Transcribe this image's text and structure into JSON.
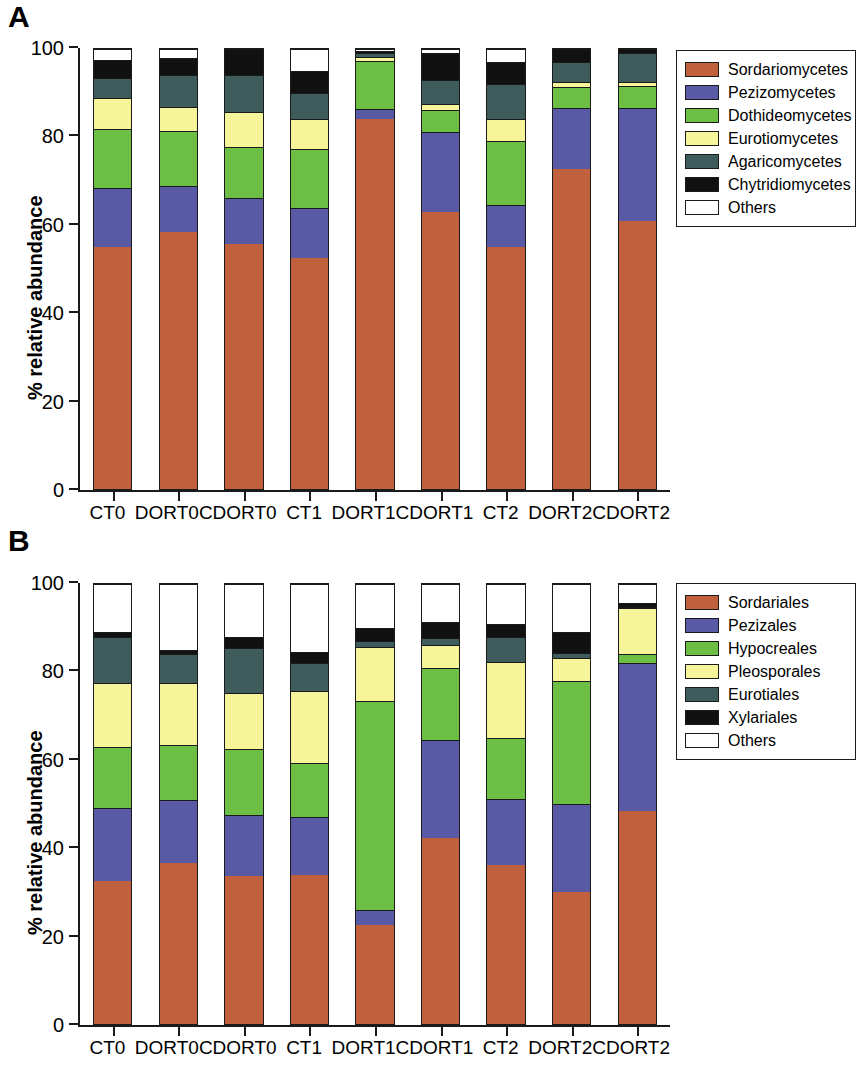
{
  "figure": {
    "panels": [
      {
        "letter": "A",
        "y_axis_title": "% relative abundance",
        "x_axis_title": "",
        "chart_data": {
          "type": "bar",
          "title": "",
          "subtitle": "",
          "xlabel": "",
          "ylabel": "% relative abundance",
          "ylim": [
            0,
            100
          ],
          "yticks": [
            0,
            20,
            40,
            60,
            80,
            100
          ],
          "grid": false,
          "stacked": true,
          "stack_mode": "percent",
          "legend_position": "right",
          "categories": [
            "CT0",
            "DORT0",
            "CDORT0",
            "CT1",
            "DORT1",
            "CDORT1",
            "CT2",
            "DORT2",
            "CDORT2"
          ],
          "series": [
            {
              "name": "Sordariomycetes",
              "color": "#c0603c",
              "values": [
                55.0,
                58.3,
                55.6,
                52.4,
                84.2,
                62.9,
                55.0,
                72.7,
                61.0
              ]
            },
            {
              "name": "Pezizomycetes",
              "color": "#595aa6",
              "values": [
                13.5,
                10.6,
                10.6,
                11.4,
                2.2,
                18.2,
                9.6,
                13.8,
                25.6
              ]
            },
            {
              "name": "Dothideomycetes",
              "color": "#6cbe45",
              "values": [
                13.4,
                12.5,
                11.5,
                13.4,
                10.9,
                5.0,
                14.4,
                4.8,
                5.0
              ]
            },
            {
              "name": "Eurotiomycetes",
              "color": "#f7f59a",
              "values": [
                7.0,
                5.5,
                8.1,
                7.0,
                1.0,
                1.5,
                5.0,
                1.2,
                1.0
              ]
            },
            {
              "name": "Agaricomycetes",
              "color": "#3e5c5c",
              "values": [
                4.6,
                7.1,
                8.2,
                5.8,
                0.7,
                5.4,
                8.0,
                4.5,
                6.4
              ]
            },
            {
              "name": "Chytridiomycetes",
              "color": "#111111",
              "values": [
                4.0,
                4.0,
                6.0,
                5.0,
                0.5,
                6.0,
                5.0,
                3.0,
                1.0
              ]
            },
            {
              "name": "Others",
              "color": "#ffffff",
              "values": [
                2.5,
                2.0,
                0.0,
                5.0,
                0.5,
                1.0,
                3.0,
                0.0,
                0.0
              ]
            }
          ]
        },
        "legend": {
          "items": [
            {
              "label": "Sordariomycetes",
              "color": "#c0603c"
            },
            {
              "label": "Pezizomycetes",
              "color": "#595aa6"
            },
            {
              "label": "Dothideomycetes",
              "color": "#6cbe45"
            },
            {
              "label": "Eurotiomycetes",
              "color": "#f7f59a"
            },
            {
              "label": "Agaricomycetes",
              "color": "#3e5c5c"
            },
            {
              "label": "Chytridiomycetes",
              "color": "#111111"
            },
            {
              "label": "Others",
              "color": "#ffffff"
            }
          ]
        }
      },
      {
        "letter": "B",
        "y_axis_title": "% relative abundance",
        "x_axis_title": "Samples",
        "chart_data": {
          "type": "bar",
          "title": "",
          "subtitle": "",
          "xlabel": "Samples",
          "ylabel": "% relative abundance",
          "ylim": [
            0,
            100
          ],
          "yticks": [
            0,
            20,
            40,
            60,
            80,
            100
          ],
          "grid": false,
          "stacked": true,
          "stack_mode": "percent",
          "legend_position": "right",
          "categories": [
            "CT0",
            "DORT0",
            "CDORT0",
            "CT1",
            "DORT1",
            "CDORT1",
            "CT2",
            "DORT2",
            "CDORT2"
          ],
          "series": [
            {
              "name": "Sordariales",
              "color": "#c0603c",
              "values": [
                32.5,
                36.7,
                33.6,
                33.9,
                22.4,
                42.2,
                36.1,
                30.1,
                48.4
              ]
            },
            {
              "name": "Pezizales",
              "color": "#595aa6",
              "values": [
                16.5,
                14.2,
                14.0,
                13.2,
                3.6,
                22.3,
                15.0,
                19.8,
                33.7
              ]
            },
            {
              "name": "Hypocreales",
              "color": "#6cbe45",
              "values": [
                14.0,
                12.6,
                15.0,
                12.2,
                47.5,
                16.4,
                13.8,
                28.0,
                1.9
              ]
            },
            {
              "name": "Pleosporales",
              "color": "#f7f59a",
              "values": [
                14.5,
                13.9,
                12.6,
                16.5,
                12.1,
                5.3,
                17.4,
                5.4,
                10.5
              ]
            },
            {
              "name": "Eurotiales",
              "color": "#3e5c5c",
              "values": [
                10.5,
                6.7,
                10.3,
                6.3,
                1.4,
                1.6,
                5.6,
                1.1,
                0.3
              ]
            },
            {
              "name": "Xylariales",
              "color": "#111111",
              "values": [
                1.0,
                1.0,
                2.5,
                2.4,
                3.0,
                3.5,
                3.1,
                4.6,
                1.0
              ]
            },
            {
              "name": "Others",
              "color": "#ffffff",
              "values": [
                11.0,
                14.9,
                12.0,
                15.5,
                10.0,
                8.7,
                9.0,
                11.0,
                4.2
              ]
            }
          ]
        },
        "legend": {
          "items": [
            {
              "label": "Sordariales",
              "color": "#c0603c"
            },
            {
              "label": "Pezizales",
              "color": "#595aa6"
            },
            {
              "label": "Hypocreales",
              "color": "#6cbe45"
            },
            {
              "label": "Pleosporales",
              "color": "#f7f59a"
            },
            {
              "label": "Eurotiales",
              "color": "#3e5c5c"
            },
            {
              "label": "Xylariales",
              "color": "#111111"
            },
            {
              "label": "Others",
              "color": "#ffffff"
            }
          ]
        }
      }
    ]
  }
}
